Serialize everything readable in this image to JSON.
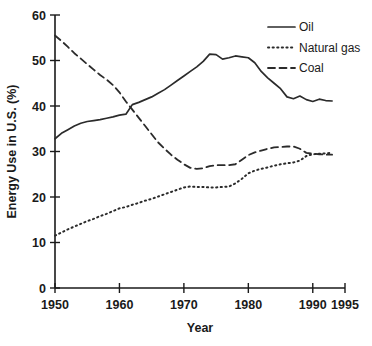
{
  "chart_data": {
    "type": "line",
    "title": "",
    "xlabel": "Year",
    "ylabel": "Energy Use in U.S. (%)",
    "xlim": [
      1950,
      1995
    ],
    "ylim": [
      0,
      60
    ],
    "xticks": [
      1950,
      1960,
      1970,
      1980,
      1990,
      1995
    ],
    "yticks": [
      0,
      10,
      20,
      30,
      40,
      50,
      60
    ],
    "xticklabels": [
      "1950",
      "1960",
      "1970",
      "1980",
      "1990",
      "1995"
    ],
    "yticklabels": [
      "0",
      "10",
      "20",
      "30",
      "40",
      "50",
      "60"
    ],
    "grid": false,
    "legend_position": "top-right",
    "series": [
      {
        "name": "Oil",
        "style": "solid",
        "x": [
          1950,
          1951,
          1952,
          1953,
          1954,
          1955,
          1956,
          1957,
          1958,
          1959,
          1960,
          1961,
          1962,
          1963,
          1964,
          1965,
          1966,
          1967,
          1968,
          1969,
          1970,
          1971,
          1972,
          1973,
          1974,
          1975,
          1976,
          1977,
          1978,
          1979,
          1980,
          1981,
          1982,
          1983,
          1984,
          1985,
          1986,
          1987,
          1988,
          1989,
          1990,
          1991,
          1992,
          1993
        ],
        "values": [
          32.8,
          34.0,
          34.8,
          35.6,
          36.2,
          36.6,
          36.8,
          37.0,
          37.3,
          37.6,
          38.0,
          38.2,
          40.3,
          40.8,
          41.4,
          42.0,
          42.8,
          43.6,
          44.6,
          45.6,
          46.6,
          47.6,
          48.6,
          49.8,
          51.4,
          51.3,
          50.3,
          50.6,
          51.0,
          50.8,
          50.6,
          49.5,
          47.6,
          46.2,
          45.0,
          43.8,
          42.0,
          41.6,
          42.2,
          41.4,
          41.0,
          41.5,
          41.2,
          41.1
        ]
      },
      {
        "name": "Natural gas",
        "style": "dotted",
        "x": [
          1950,
          1951,
          1952,
          1953,
          1954,
          1955,
          1956,
          1957,
          1958,
          1959,
          1960,
          1961,
          1962,
          1963,
          1964,
          1965,
          1966,
          1967,
          1968,
          1969,
          1970,
          1971,
          1972,
          1973,
          1974,
          1975,
          1976,
          1977,
          1978,
          1979,
          1980,
          1981,
          1982,
          1983,
          1984,
          1985,
          1986,
          1987,
          1988,
          1989,
          1990,
          1991,
          1992,
          1993
        ],
        "values": [
          11.5,
          12.2,
          12.9,
          13.5,
          14.1,
          14.7,
          15.2,
          15.8,
          16.3,
          16.9,
          17.5,
          17.8,
          18.3,
          18.7,
          19.2,
          19.6,
          20.1,
          20.6,
          21.1,
          21.6,
          22.1,
          22.3,
          22.2,
          22.2,
          22.1,
          22.1,
          22.2,
          22.3,
          23.0,
          24.0,
          25.2,
          25.8,
          26.2,
          26.5,
          26.9,
          27.2,
          27.4,
          27.6,
          28.0,
          29.0,
          29.4,
          29.5,
          29.6,
          29.7
        ]
      },
      {
        "name": "Coal",
        "style": "dashed",
        "x": [
          1950,
          1951,
          1952,
          1953,
          1954,
          1955,
          1956,
          1957,
          1958,
          1959,
          1960,
          1961,
          1962,
          1963,
          1964,
          1965,
          1966,
          1967,
          1968,
          1969,
          1970,
          1971,
          1972,
          1973,
          1974,
          1975,
          1976,
          1977,
          1978,
          1979,
          1980,
          1981,
          1982,
          1983,
          1984,
          1985,
          1986,
          1987,
          1988,
          1989,
          1990,
          1991,
          1992,
          1993
        ],
        "values": [
          55.5,
          54.3,
          53.0,
          51.6,
          50.4,
          49.2,
          48.0,
          46.8,
          45.8,
          44.6,
          43.0,
          41.0,
          39.2,
          37.4,
          35.6,
          33.8,
          32.0,
          30.6,
          29.3,
          28.2,
          27.2,
          26.4,
          26.2,
          26.3,
          26.8,
          27.0,
          27.0,
          27.0,
          27.2,
          28.2,
          29.2,
          29.8,
          30.2,
          30.6,
          30.9,
          31.0,
          31.1,
          31.1,
          30.6,
          29.7,
          29.5,
          29.4,
          29.3,
          29.3
        ]
      }
    ]
  }
}
